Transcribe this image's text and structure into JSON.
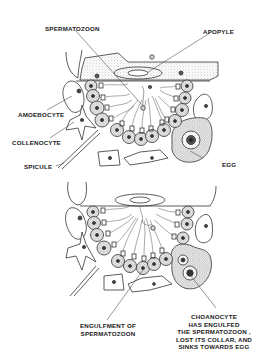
{
  "figure": {
    "panels": [
      {
        "id": "top",
        "labels": {
          "spermatozoon": "SPERMATOZOON",
          "apopyle": "APOPYLE",
          "amoebocyte": "AMOEBOCYTE",
          "collenocyte": "COLLENOCYTE",
          "spicule": "SPICULE",
          "egg": "EGG"
        }
      },
      {
        "id": "bottom",
        "labels": {
          "engulfment_line1": "ENGULFMENT OF",
          "engulfment_line2": "SPERMATOZOON",
          "choanocyte_line1": "CHOANOCYTE",
          "choanocyte_line2": "HAS ENGULFED",
          "choanocyte_line3": "THE SPERMATOZOON ,",
          "choanocyte_line4": "LOST ITS COLLAR, AND",
          "choanocyte_line5": "SINKS TOWARDS EGG"
        }
      }
    ],
    "colors": {
      "line": "#333333",
      "stipple": "#9a9a9a",
      "nucleus": "#3a3a3a",
      "background": "#ffffff"
    }
  }
}
